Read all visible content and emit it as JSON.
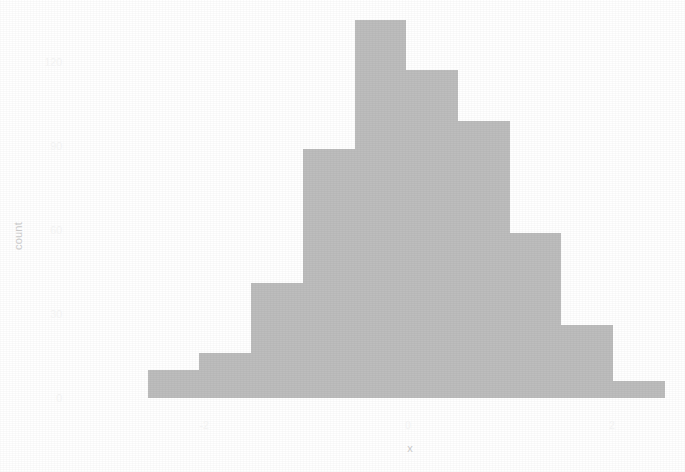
{
  "chart_data": {
    "type": "bar",
    "chart_kind": "histogram",
    "title": "",
    "subtitle": "",
    "xlabel": "x",
    "ylabel": "count",
    "grid": false,
    "legend": false,
    "legend_position": "none",
    "bar_color": "#bdbdbd",
    "background_color": "#ffffff",
    "binwidth": 0.5,
    "bins": 10,
    "xlim": [
      -2.55,
      2.52
    ],
    "ylim": [
      0,
      135
    ],
    "x_ticks": [
      -2,
      0,
      2
    ],
    "x_tick_labels": [
      "-2",
      "0",
      "2"
    ],
    "y_ticks": [
      0,
      30,
      60,
      90,
      120
    ],
    "y_tick_labels": [
      "0",
      "30",
      "60",
      "90",
      "120"
    ],
    "categories": [
      "[-2.55,-2.05)",
      "[-2.05,-1.54)",
      "[-1.54,-1.03)",
      "[-1.03,-0.52)",
      "[-0.52,-0.02)",
      "[-0.02,0.49)",
      "[0.49,1.00)",
      "[1.00,1.50)",
      "[1.50,2.01)",
      "[2.01,2.52)"
    ],
    "bin_starts": [
      -2.55,
      -2.05,
      -1.54,
      -1.03,
      -0.52,
      -0.02,
      0.49,
      1.0,
      1.5,
      2.01
    ],
    "bin_ends": [
      -2.05,
      -1.54,
      -1.03,
      -0.52,
      -0.02,
      0.49,
      1.0,
      1.5,
      2.01,
      2.52
    ],
    "bin_centers": [
      -2.3,
      -1.79,
      -1.29,
      -0.78,
      -0.27,
      0.23,
      0.74,
      1.25,
      1.75,
      2.26
    ],
    "values": [
      10,
      16,
      41,
      89,
      135,
      117,
      99,
      59,
      26,
      6
    ]
  }
}
